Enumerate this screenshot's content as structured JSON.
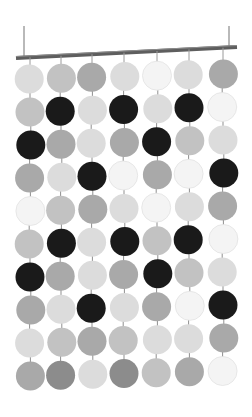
{
  "image": {
    "subject": "Hanging disc curtain / room divider mobile",
    "background": "#ffffff",
    "bar": {
      "color": "#5e5e5e",
      "left": {
        "x": 16,
        "y": 58
      },
      "right": {
        "x": 237,
        "y": 47
      },
      "thickness": 4,
      "wires": [
        {
          "x": 24,
          "top": 26,
          "bottom": 58
        },
        {
          "x": 229,
          "top": 26,
          "bottom": 48
        }
      ]
    },
    "grid": {
      "columns_x": [
        30,
        61,
        92,
        124,
        157,
        189,
        223
      ],
      "row1_left_y": 79,
      "row1_right_y": 74,
      "row_spacing": 33,
      "radius": 14.5,
      "shades": {
        "W": "#f4f4f4",
        "L": "#dcdcdc",
        "ML": "#c2c2c2",
        "M": "#a9a9a9",
        "DM": "#8c8c8c",
        "D": "#1a1a1a"
      },
      "rows": [
        [
          "L",
          "ML",
          "M",
          "L",
          "W",
          "L",
          "M"
        ],
        [
          "ML",
          "D",
          "L",
          "D",
          "L",
          "D",
          "W"
        ],
        [
          "D",
          "M",
          "L",
          "M",
          "D",
          "ML",
          "L"
        ],
        [
          "M",
          "L",
          "D",
          "W",
          "M",
          "W",
          "D"
        ],
        [
          "W",
          "ML",
          "M",
          "L",
          "W",
          "L",
          "M"
        ],
        [
          "ML",
          "D",
          "L",
          "D",
          "ML",
          "D",
          "W"
        ],
        [
          "D",
          "M",
          "L",
          "M",
          "D",
          "ML",
          "L"
        ],
        [
          "M",
          "L",
          "D",
          "L",
          "M",
          "W",
          "D"
        ],
        [
          "L",
          "ML",
          "M",
          "ML",
          "L",
          "L",
          "M"
        ],
        [
          "M",
          "DM",
          "L",
          "DM",
          "ML",
          "M",
          "W"
        ]
      ]
    }
  }
}
